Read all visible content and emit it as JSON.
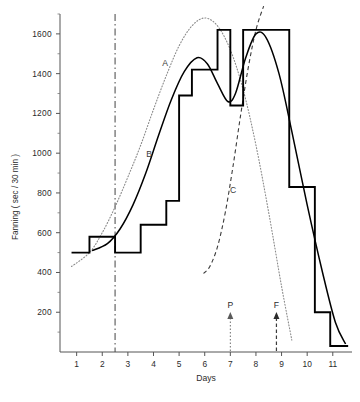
{
  "chart_data": {
    "type": "line",
    "title": "",
    "xlabel": "Days",
    "ylabel": "Fanning ( sec / 30 min )",
    "xlim": [
      0.35,
      11.75
    ],
    "ylim": [
      0,
      1700
    ],
    "grid": false,
    "legend_position": "inline-curve-labels",
    "y_tick_labels": [
      "200",
      "400",
      "600",
      "800",
      "1000",
      "1200",
      "1400",
      "1600"
    ],
    "y_tick_values": [
      200,
      400,
      600,
      800,
      1000,
      1200,
      1400,
      1600
    ],
    "y_minor_tick_values": [
      100,
      300,
      500,
      700,
      900,
      1100,
      1300,
      1500,
      1700
    ],
    "x_tick_labels": [
      "1",
      "2",
      "3",
      "4",
      "5",
      "6",
      "7",
      "8",
      "9",
      "10",
      "11"
    ],
    "x_tick_values": [
      1,
      2,
      3,
      4,
      5,
      6,
      7,
      8,
      9,
      10,
      11
    ],
    "series": [
      {
        "name": "step-histogram",
        "label": "",
        "style": "step",
        "x": [
          0.8,
          1.5,
          1.5,
          2.5,
          2.5,
          3.5,
          3.5,
          4.5,
          4.5,
          5.0,
          5.0,
          5.5,
          5.5,
          6.5,
          6.5,
          7.0,
          7.0,
          7.5,
          7.5,
          8.5,
          8.5,
          9.3,
          9.3,
          10.3,
          10.3,
          10.9,
          10.9,
          11.6
        ],
        "values": [
          500,
          500,
          580,
          580,
          500,
          500,
          640,
          640,
          760,
          760,
          1290,
          1290,
          1420,
          1420,
          1620,
          1620,
          1240,
          1240,
          1620,
          1620,
          1620,
          1620,
          830,
          830,
          200,
          200,
          30,
          30
        ]
      },
      {
        "name": "curve-A",
        "label": "A",
        "style": "dotted",
        "description": "broad bell curve peaking near day 6",
        "x": [
          0.8,
          1.5,
          2.0,
          2.5,
          3.0,
          3.5,
          4.0,
          4.5,
          5.0,
          5.5,
          6.0,
          6.5,
          7.0,
          7.5,
          8.0,
          8.5,
          9.0,
          9.4
        ],
        "values": [
          430,
          500,
          600,
          730,
          880,
          1040,
          1220,
          1390,
          1540,
          1640,
          1680,
          1640,
          1520,
          1320,
          1040,
          700,
          330,
          60
        ]
      },
      {
        "name": "curve-B",
        "label": "B",
        "style": "solid",
        "description": "bimodal fitted envelope following the step data",
        "x": [
          1.6,
          2.2,
          2.7,
          3.2,
          3.7,
          4.2,
          4.7,
          5.2,
          5.7,
          6.1,
          6.5,
          6.9,
          7.2,
          7.6,
          8.0,
          8.4,
          8.9,
          9.4,
          10.0,
          10.6,
          11.1,
          11.5
        ],
        "values": [
          510,
          545,
          620,
          740,
          900,
          1090,
          1270,
          1410,
          1480,
          1450,
          1350,
          1260,
          1300,
          1480,
          1600,
          1580,
          1400,
          1110,
          740,
          400,
          150,
          40
        ]
      },
      {
        "name": "curve-C",
        "label": "C",
        "style": "dashed",
        "description": "rising sigmoid starting near day 6",
        "x": [
          5.95,
          6.2,
          6.5,
          6.8,
          7.1,
          7.4,
          7.7,
          8.0,
          8.3
        ],
        "values": [
          395,
          430,
          530,
          700,
          930,
          1190,
          1430,
          1620,
          1740
        ]
      }
    ],
    "annotations": [
      {
        "name": "vertical-marker-line",
        "style": "dash-dot",
        "x": 2.5,
        "label": ""
      },
      {
        "name": "event-marker-P",
        "label": "P",
        "style": "dotted-arrow",
        "x": 7.0
      },
      {
        "name": "event-marker-F",
        "label": "F",
        "style": "dashed-arrow",
        "x": 8.8
      }
    ]
  },
  "curve_labels": {
    "a": "A",
    "b": "B",
    "c": "C"
  },
  "axes": {
    "x_title": "Days",
    "y_title": "Fanning ( sec / 30 min )"
  },
  "events": {
    "p": "P",
    "f": "F"
  }
}
